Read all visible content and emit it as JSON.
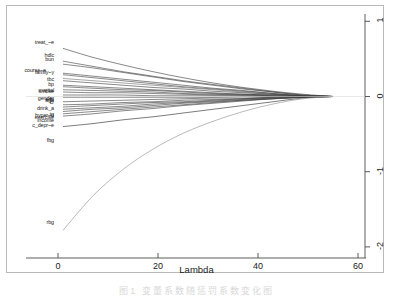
{
  "figure": {
    "caption": "图1  变量系数随惩罚系数变化图",
    "background_color": "#ffffff",
    "frame_color": "#b9b9b9"
  },
  "chart_data": {
    "type": "line",
    "title": "",
    "xlabel": "Lambda",
    "ylabel": "",
    "xlim": [
      -2,
      63
    ],
    "ylim": [
      -2.1,
      1.15
    ],
    "xticks": [
      0,
      20,
      40,
      60
    ],
    "xtick_labels": [
      "0",
      "20",
      "40",
      "60"
    ],
    "yticks": [
      1,
      0,
      -1,
      -2
    ],
    "ytick_labels": [
      "1",
      "0",
      "-1",
      "-2"
    ],
    "yaxis_position": "right",
    "grid": false,
    "legend": "none",
    "convergence_lambda": 55,
    "series": [
      {
        "name": "treat_~e",
        "color": "#404040",
        "start_lambda": 1.0,
        "values": [
          0.64,
          0.52,
          0.42,
          0.33,
          0.25,
          0.18,
          0.12,
          0.07,
          0.03,
          0.0
        ]
      },
      {
        "name": "ldlc",
        "color": "#404040",
        "start_lambda": 1.0,
        "values": [
          0.47,
          0.4,
          0.33,
          0.27,
          0.21,
          0.16,
          0.11,
          0.06,
          0.02,
          0.0
        ]
      },
      {
        "name": "bun",
        "color": "#404040",
        "start_lambda": 1.0,
        "values": [
          0.43,
          0.38,
          0.32,
          0.26,
          0.2,
          0.15,
          0.1,
          0.06,
          0.02,
          0.0
        ]
      },
      {
        "name": "course~e",
        "color": "#404040",
        "start_lambda": 1.0,
        "values": [
          0.31,
          0.27,
          0.23,
          0.19,
          0.15,
          0.11,
          0.08,
          0.04,
          0.01,
          0.0
        ]
      },
      {
        "name": "family~y",
        "color": "#404040",
        "start_lambda": 1.0,
        "values": [
          0.29,
          0.25,
          0.21,
          0.17,
          0.13,
          0.1,
          0.07,
          0.04,
          0.01,
          0.0
        ]
      },
      {
        "name": "tbc",
        "color": "#6e6e6e",
        "start_lambda": 1.0,
        "values": [
          0.24,
          0.21,
          0.18,
          0.15,
          0.12,
          0.09,
          0.06,
          0.03,
          0.01,
          0.0
        ]
      },
      {
        "name": "bp",
        "color": "#404040",
        "start_lambda": 1.0,
        "values": [
          0.21,
          0.18,
          0.15,
          0.12,
          0.1,
          0.07,
          0.05,
          0.03,
          0.01,
          0.0
        ]
      },
      {
        "name": "smoke",
        "color": "#404040",
        "start_lambda": 1.0,
        "values": [
          0.15,
          0.13,
          0.11,
          0.09,
          0.07,
          0.05,
          0.03,
          0.02,
          0.01,
          0.0
        ]
      },
      {
        "name": "marital",
        "color": "#404040",
        "start_lambda": 1.0,
        "values": [
          0.13,
          0.11,
          0.09,
          0.08,
          0.06,
          0.04,
          0.03,
          0.02,
          0.01,
          0.0
        ]
      },
      {
        "name": "gender",
        "color": "#404040",
        "start_lambda": 1.0,
        "values": [
          0.09,
          0.08,
          0.07,
          0.06,
          0.04,
          0.03,
          0.02,
          0.01,
          0.0,
          0.0
        ]
      },
      {
        "name": "edu",
        "color": "#404040",
        "start_lambda": 1.0,
        "values": [
          0.06,
          0.05,
          0.05,
          0.04,
          0.03,
          0.02,
          0.02,
          0.01,
          0.0,
          0.0
        ]
      },
      {
        "name": "age",
        "color": "#404040",
        "start_lambda": 1.0,
        "values": [
          0.02,
          0.02,
          0.02,
          0.01,
          0.01,
          0.01,
          0.01,
          0.0,
          0.0,
          0.0
        ]
      },
      {
        "name": "cr",
        "color": "#404040",
        "start_lambda": 1.0,
        "values": [
          -0.01,
          -0.01,
          -0.01,
          -0.01,
          -0.01,
          -0.01,
          0.0,
          0.0,
          0.0,
          0.0
        ]
      },
      {
        "name": "drink_a",
        "color": "#404040",
        "start_lambda": 1.0,
        "values": [
          -0.07,
          -0.06,
          -0.05,
          -0.04,
          -0.03,
          -0.02,
          -0.02,
          -0.01,
          0.0,
          0.0
        ]
      },
      {
        "name": "hdlc",
        "color": "#404040",
        "start_lambda": 1.0,
        "values": [
          -0.11,
          -0.1,
          -0.08,
          -0.07,
          -0.05,
          -0.04,
          -0.03,
          -0.01,
          0.0,
          0.0
        ]
      },
      {
        "name": "tg",
        "color": "#404040",
        "start_lambda": 1.0,
        "values": [
          -0.14,
          -0.12,
          -0.1,
          -0.08,
          -0.07,
          -0.05,
          -0.03,
          -0.02,
          -0.01,
          0.0
        ]
      },
      {
        "name": "exercise",
        "color": "#404040",
        "start_lambda": 1.0,
        "values": [
          -0.17,
          -0.15,
          -0.13,
          -0.1,
          -0.08,
          -0.06,
          -0.04,
          -0.02,
          -0.01,
          0.0
        ]
      },
      {
        "name": "income",
        "color": "#404040",
        "start_lambda": 1.0,
        "values": [
          -0.2,
          -0.17,
          -0.15,
          -0.12,
          -0.09,
          -0.07,
          -0.05,
          -0.03,
          -0.01,
          0.0
        ]
      },
      {
        "name": "hyper~n",
        "color": "#404040",
        "start_lambda": 1.0,
        "values": [
          -0.23,
          -0.2,
          -0.17,
          -0.14,
          -0.11,
          -0.08,
          -0.05,
          -0.03,
          -0.01,
          0.0
        ]
      },
      {
        "name": "c_depr~e",
        "color": "#404040",
        "start_lambda": 1.0,
        "values": [
          -0.26,
          -0.23,
          -0.19,
          -0.16,
          -0.12,
          -0.09,
          -0.06,
          -0.03,
          -0.01,
          0.0
        ]
      },
      {
        "name": "fbg",
        "color": "#2b2b2b",
        "start_lambda": 1.0,
        "values": [
          -0.4,
          -0.36,
          -0.31,
          -0.27,
          -0.22,
          -0.17,
          -0.12,
          -0.07,
          -0.02,
          0.0
        ]
      },
      {
        "name": "rbg",
        "color": "#8f8f8f",
        "start_lambda": 1.0,
        "values": [
          -1.78,
          -1.32,
          -0.97,
          -0.7,
          -0.49,
          -0.33,
          -0.2,
          -0.1,
          -0.03,
          0.0
        ]
      }
    ],
    "lambda_grid": [
      1,
      7,
      13,
      19,
      25,
      31,
      37,
      43,
      49,
      55
    ]
  },
  "variable_labels": [
    {
      "text": "treat_~e",
      "x": 54,
      "y": 43
    },
    {
      "text": "hdlc",
      "x": 54,
      "y": 56
    },
    {
      "text": "bun",
      "x": 54,
      "y": 60
    },
    {
      "text": "course~e",
      "x": 46,
      "y": 71
    },
    {
      "text": "family~y",
      "x": 54,
      "y": 73
    },
    {
      "text": "tbc",
      "x": 54,
      "y": 80
    },
    {
      "text": "bp",
      "x": 54,
      "y": 85
    },
    {
      "text": "marital",
      "x": 54,
      "y": 91
    },
    {
      "text": "smoke",
      "x": 54,
      "y": 92
    },
    {
      "text": "gender",
      "x": 54,
      "y": 99
    },
    {
      "text": "edu",
      "x": 54,
      "y": 100
    },
    {
      "text": "age",
      "x": 54,
      "y": 101
    },
    {
      "text": "cr",
      "x": 54,
      "y": 103
    },
    {
      "text": "drink_a",
      "x": 54,
      "y": 109
    },
    {
      "text": "tg",
      "x": 54,
      "y": 115
    },
    {
      "text": "hyper~n",
      "x": 54,
      "y": 116
    },
    {
      "text": "exercise",
      "x": 54,
      "y": 118
    },
    {
      "text": "income",
      "x": 54,
      "y": 121
    },
    {
      "text": "c_depr~e",
      "x": 54,
      "y": 126
    },
    {
      "text": "fbg",
      "x": 54,
      "y": 141
    },
    {
      "text": "rbg",
      "x": 54,
      "y": 223
    }
  ]
}
